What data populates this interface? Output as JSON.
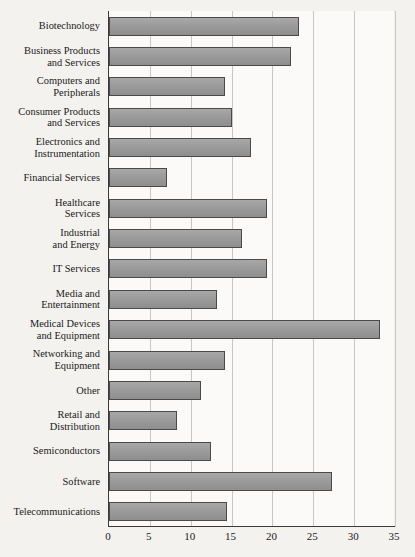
{
  "chart_data": {
    "type": "bar",
    "orientation": "horizontal",
    "title": "",
    "subtitle": "",
    "xlabel": "",
    "ylabel": "",
    "xlim": [
      0,
      35
    ],
    "xticks": [
      0,
      5,
      10,
      15,
      20,
      25,
      30,
      35
    ],
    "grid": "vertical",
    "legend": "none",
    "bar_color": "#9b9b9b",
    "bar_edge_color": "#4a4a4a",
    "background_color": "#f4f2ef",
    "plot_background_color": "#fbfaf8",
    "gridline_color": "#c9c7c4",
    "axis_color": "#3a3a3a",
    "categories": [
      "Biotechnology",
      "Business Products and Services",
      "Computers and Peripherals",
      "Consumer Products and Services",
      "Electronics and Instrumentation",
      "Financial Services",
      "Healthcare Services",
      "Industrial and Energy",
      "IT Services",
      "Media and Entertainment",
      "Medical Devices and Equipment",
      "Networking and Equipment",
      "Other",
      "Retail and Distribution",
      "Semiconductors",
      "Software",
      "Telecommunications"
    ],
    "category_label_lines": [
      [
        "Biotechnology"
      ],
      [
        "Business Products",
        "and Services"
      ],
      [
        "Computers and",
        "Peripherals"
      ],
      [
        "Consumer Products",
        "and Services"
      ],
      [
        "Electronics and",
        "Instrumentation"
      ],
      [
        "Financial Services"
      ],
      [
        "Healthcare",
        "Services"
      ],
      [
        "Industrial",
        "and Energy"
      ],
      [
        "IT Services"
      ],
      [
        "Media and",
        "Entertainment"
      ],
      [
        "Medical Devices",
        "and Equipment"
      ],
      [
        "Networking and",
        "Equipment"
      ],
      [
        "Other"
      ],
      [
        "Retail and",
        "Distribution"
      ],
      [
        "Semiconductors"
      ],
      [
        "Software"
      ],
      [
        "Telecommunications"
      ]
    ],
    "values": [
      23.2,
      22.3,
      14.2,
      15.1,
      17.4,
      7.1,
      19.3,
      16.3,
      19.3,
      13.2,
      33.2,
      14.2,
      11.3,
      8.3,
      12.5,
      27.3,
      14.4
    ]
  }
}
